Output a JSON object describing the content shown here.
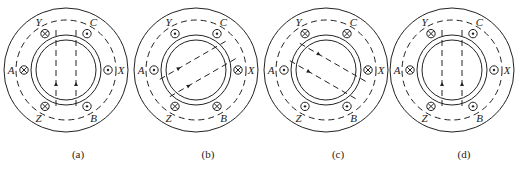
{
  "figure": {
    "panels": [
      {
        "id": "a",
        "caption": "(a)",
        "cx": 66,
        "cy": 70,
        "axis_angle": 90,
        "slots": {
          "A": "cross",
          "X": "dot",
          "Y": "cross",
          "Z": "cross",
          "B": "dot",
          "C": "dot"
        }
      },
      {
        "id": "b",
        "caption": "(b)",
        "cx": 196,
        "cy": 70,
        "axis_angle": 30,
        "slots": {
          "A": "dot",
          "X": "cross",
          "Y": "dot",
          "Z": "cross",
          "B": "cross",
          "C": "dot"
        }
      },
      {
        "id": "c",
        "caption": "(c)",
        "cx": 326,
        "cy": 70,
        "axis_angle": -30,
        "slots": {
          "A": "dot",
          "X": "cross",
          "Y": "cross",
          "Z": "dot",
          "B": "dot",
          "C": "cross"
        }
      },
      {
        "id": "d",
        "caption": "(d)",
        "cx": 452,
        "cy": 70,
        "axis_angle": 90,
        "slots": {
          "A": "cross",
          "X": "dot",
          "Y": "cross",
          "Z": "cross",
          "B": "dot",
          "C": "dot"
        }
      }
    ],
    "slot_angles": {
      "A": 180,
      "X": 0,
      "Y": 120,
      "C": 60,
      "Z": 240,
      "B": 300
    },
    "labels": {
      "A": "A",
      "X": "X",
      "Y": "Y",
      "Z": "Z",
      "B": "B",
      "C": "C"
    }
  }
}
